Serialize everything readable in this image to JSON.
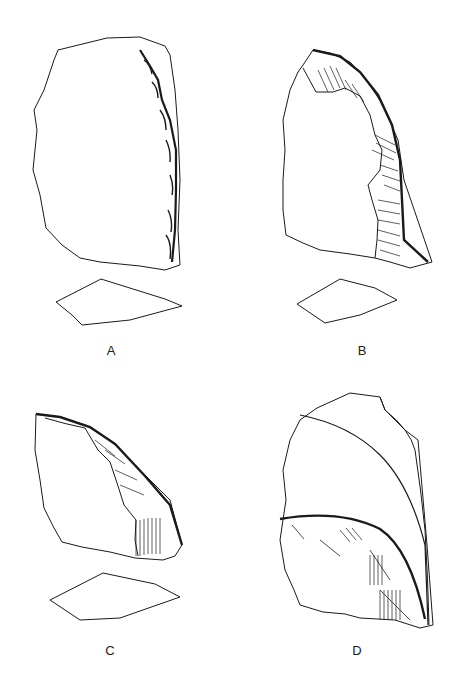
{
  "figure": {
    "type": "lithic-artifact-illustration",
    "panels": [
      {
        "id": "A",
        "label": "A",
        "description": "Flake with retouched right edge, plan view and cross-section"
      },
      {
        "id": "B",
        "label": "B",
        "description": "Flake with extensive invasive retouch on curved right edge, plan view and cross-section"
      },
      {
        "id": "C",
        "label": "C",
        "description": "Fragment with retouched oblique upper edge, plan view and cross-section"
      },
      {
        "id": "D",
        "label": "D",
        "description": "Artifact showing two overlapping retouched arcs, plan view"
      }
    ]
  },
  "colors": {
    "ink": "#1a1a1a",
    "background": "#ffffff",
    "stipple": "#9a9a9a"
  }
}
